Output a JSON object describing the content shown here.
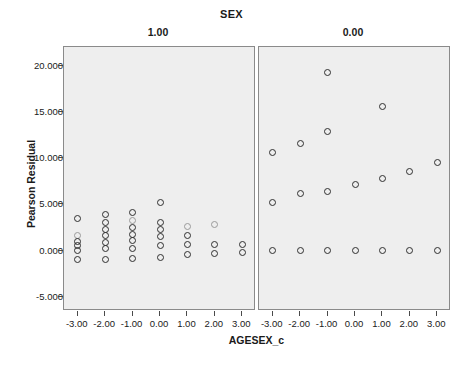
{
  "chart_data": {
    "type": "scatter",
    "title": "SEX",
    "xlabel": "AGESEX_c",
    "ylabel": "Pearson Residual",
    "xlim": [
      -3.5,
      3.5
    ],
    "ylim": [
      -6.5,
      22.0
    ],
    "grid": false,
    "legend": "none",
    "x_ticks": [
      "-3.00",
      "-2.00",
      "-1.00",
      "0.00",
      "1.00",
      "2.00",
      "3.00"
    ],
    "x_tick_values": [
      -3,
      -2,
      -1,
      0,
      1,
      2,
      3
    ],
    "y_ticks": [
      "20.000",
      "15.000",
      "10.000",
      "5.000",
      "0.000",
      "-5.000"
    ],
    "y_tick_values": [
      20,
      15,
      10,
      5,
      0,
      -5
    ],
    "panel_variable": "SEX",
    "panels": [
      {
        "label": "1.00",
        "points": [
          {
            "x": -3,
            "y": 3.5
          },
          {
            "x": -3,
            "y": 1.7,
            "faint": true
          },
          {
            "x": -3,
            "y": 1.0
          },
          {
            "x": -3,
            "y": 0.6
          },
          {
            "x": -3,
            "y": 0.0
          },
          {
            "x": -3,
            "y": -0.9
          },
          {
            "x": -2,
            "y": 3.9
          },
          {
            "x": -2,
            "y": 3.1
          },
          {
            "x": -2,
            "y": 2.3
          },
          {
            "x": -2,
            "y": 1.6
          },
          {
            "x": -2,
            "y": 0.9
          },
          {
            "x": -2,
            "y": 0.2
          },
          {
            "x": -2,
            "y": -0.9
          },
          {
            "x": -1,
            "y": 4.1
          },
          {
            "x": -1,
            "y": 3.3,
            "faint": true
          },
          {
            "x": -1,
            "y": 2.5
          },
          {
            "x": -1,
            "y": 1.8
          },
          {
            "x": -1,
            "y": 1.1
          },
          {
            "x": -1,
            "y": 0.3
          },
          {
            "x": -1,
            "y": -0.8
          },
          {
            "x": 0,
            "y": 5.2
          },
          {
            "x": 0,
            "y": 3.1
          },
          {
            "x": 0,
            "y": 2.3
          },
          {
            "x": 0,
            "y": 1.5
          },
          {
            "x": 0,
            "y": 0.6
          },
          {
            "x": 0,
            "y": -0.7
          },
          {
            "x": 1,
            "y": 2.6,
            "faint": true
          },
          {
            "x": 1,
            "y": 1.6
          },
          {
            "x": 1,
            "y": 0.7
          },
          {
            "x": 1,
            "y": -0.4
          },
          {
            "x": 2,
            "y": 2.8,
            "faint": true
          },
          {
            "x": 2,
            "y": 0.7
          },
          {
            "x": 2,
            "y": -0.3
          },
          {
            "x": 3,
            "y": 0.7
          },
          {
            "x": 3,
            "y": -0.2
          }
        ]
      },
      {
        "label": "0.00",
        "points": [
          {
            "x": -3,
            "y": 10.6
          },
          {
            "x": -3,
            "y": 5.2
          },
          {
            "x": -3,
            "y": 0.0
          },
          {
            "x": -2,
            "y": 11.6
          },
          {
            "x": -2,
            "y": 6.2
          },
          {
            "x": -2,
            "y": 0.0
          },
          {
            "x": -1,
            "y": 19.3
          },
          {
            "x": -1,
            "y": 12.9
          },
          {
            "x": -1,
            "y": 6.4
          },
          {
            "x": -1,
            "y": 0.0
          },
          {
            "x": 0,
            "y": 7.2
          },
          {
            "x": 0,
            "y": 0.0
          },
          {
            "x": 1,
            "y": 15.6
          },
          {
            "x": 1,
            "y": 7.8
          },
          {
            "x": 1,
            "y": 0.0
          },
          {
            "x": 2,
            "y": 8.6
          },
          {
            "x": 2,
            "y": 0.0
          },
          {
            "x": 3,
            "y": 9.5
          },
          {
            "x": 3,
            "y": 0.0
          }
        ]
      }
    ]
  },
  "colors": {
    "panel_background": "#eeeeee",
    "panel_border": "#8a8a8a",
    "marker_stroke": "#2f2f2f",
    "marker_stroke_faint": "#9a9a9a",
    "text": "#1a1a1a"
  }
}
